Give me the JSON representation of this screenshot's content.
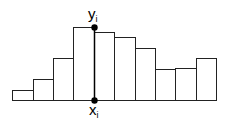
{
  "diagram": {
    "type": "histogram-step",
    "baseline_y": 100,
    "bars": [
      {
        "x0": 12,
        "x1": 33,
        "top": 90
      },
      {
        "x0": 33,
        "x1": 53,
        "top": 79
      },
      {
        "x0": 53,
        "x1": 73,
        "top": 58
      },
      {
        "x0": 73,
        "x1": 94,
        "top": 27
      },
      {
        "x0": 94,
        "x1": 114,
        "top": 32
      },
      {
        "x0": 114,
        "x1": 135,
        "top": 37
      },
      {
        "x0": 135,
        "x1": 155,
        "top": 48
      },
      {
        "x0": 155,
        "x1": 175,
        "top": 69
      },
      {
        "x0": 175,
        "x1": 196,
        "top": 68
      },
      {
        "x0": 196,
        "x1": 216,
        "top": 58
      }
    ],
    "marker_x": 94,
    "top_point_y": 27,
    "bottom_point_y": 100,
    "label_top": {
      "base": "y",
      "sub": "i"
    },
    "label_bottom": {
      "base": "x",
      "sub": "i"
    }
  }
}
